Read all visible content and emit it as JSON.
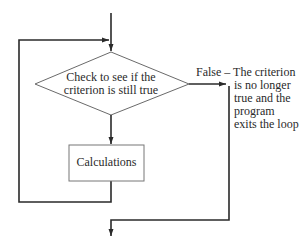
{
  "diagram": {
    "type": "flowchart",
    "nodes": {
      "decision": {
        "shape": "diamond",
        "lines": [
          "Check to see if the",
          "criterion is still true"
        ]
      },
      "process": {
        "shape": "rectangle",
        "label": "Calculations"
      }
    },
    "edges": {
      "entry": {
        "from": "start",
        "to": "decision"
      },
      "true_branch": {
        "from": "decision",
        "to": "process"
      },
      "loop_back": {
        "from": "process",
        "to": "decision"
      },
      "false_branch": {
        "from": "decision",
        "to": "exit",
        "label_head": "False – The criterion",
        "label_lines": [
          "is no longer",
          "true and the",
          "program",
          "exits the loop"
        ]
      }
    },
    "colors": {
      "stroke": "#2a2a2a",
      "diamond_stroke": "#6a6a6a",
      "box_stroke": "#777777",
      "background": "#ffffff"
    }
  }
}
